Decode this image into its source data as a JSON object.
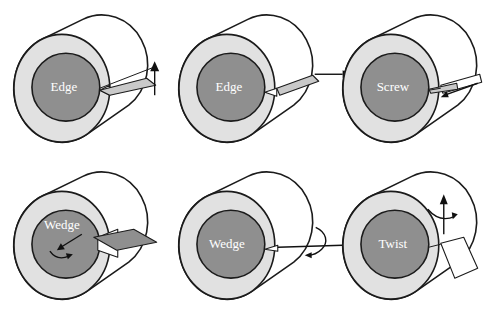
{
  "figure": {
    "colors": {
      "core": "#8f8f8f",
      "annulus": "#e1e1e1",
      "side": "#ffffff",
      "cut_face": "#c9c9c9",
      "outline": "#1b1b1b"
    },
    "panels": [
      {
        "label": "Edge",
        "arrow_icon": "up-arrow"
      },
      {
        "label": "Edge",
        "arrow_icon": "right-arrow"
      },
      {
        "label": "Screw",
        "arrow_icon": "inward-axial-arrow"
      },
      {
        "label": "Wedge",
        "arrow_icon": "inward-arrow-with-rotation-arc"
      },
      {
        "label": "Wedge",
        "arrow_icon": "right-arrow-with-axial-rotation-arc"
      },
      {
        "label": "Twist",
        "arrow_icon": "up-arrow-with-rotation-arc"
      }
    ]
  }
}
